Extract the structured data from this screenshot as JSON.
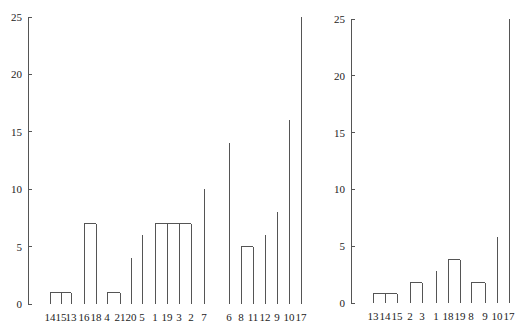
{
  "chart_data": [
    {
      "type": "dendrogram",
      "title": "",
      "ylim": [
        0,
        25
      ],
      "yticks": [
        0,
        5,
        10,
        15,
        20,
        25
      ],
      "leaves": [
        "14",
        "15",
        "13",
        "16",
        "18",
        "4",
        "21",
        "20",
        "5",
        "1",
        "19",
        "3",
        "2",
        "7",
        "6",
        "8",
        "11",
        "12",
        "9",
        "10",
        "17"
      ],
      "merges": [
        {
          "members": [
            "14",
            "15",
            "13"
          ],
          "height": 1
        },
        {
          "members": [
            "4",
            "21"
          ],
          "height": 1
        },
        {
          "members": [
            "(4,21)",
            "20"
          ],
          "height": 4
        },
        {
          "members": [
            "(4,21,20)",
            "5"
          ],
          "height": 6
        },
        {
          "members": [
            "(4,21,20,5)",
            "1",
            "19",
            "3",
            "2"
          ],
          "height": 7
        },
        {
          "members": [
            "16",
            "18"
          ],
          "height": 7
        },
        {
          "members": [
            "(16,18)",
            "(4,21,20,5,1,19,3,2)"
          ],
          "height": 8
        },
        {
          "members": [
            "(16..2)",
            "7"
          ],
          "height": 10
        },
        {
          "members": [
            "(14,15,13)",
            "(16..7)"
          ],
          "height": 13
        },
        {
          "members": [
            "(14..7)",
            "6"
          ],
          "height": 14
        },
        {
          "members": [
            "8",
            "11"
          ],
          "height": 5
        },
        {
          "members": [
            "(8,11)",
            "12"
          ],
          "height": 6
        },
        {
          "members": [
            "(8,11,12)",
            "9"
          ],
          "height": 8
        },
        {
          "members": [
            "(14..6)",
            "(8,11,12,9)",
            "10"
          ],
          "height": 16
        },
        {
          "members": [
            "(14..10)",
            "17"
          ],
          "height": 25
        }
      ]
    },
    {
      "type": "dendrogram",
      "title": "",
      "ylim": [
        0,
        25
      ],
      "yticks": [
        0,
        5,
        10,
        15,
        20,
        25
      ],
      "leaves": [
        "13",
        "14",
        "15",
        "2",
        "3",
        "1",
        "18",
        "19",
        "8",
        "9",
        "10",
        "17"
      ],
      "merges": [
        {
          "members": [
            "13",
            "14",
            "15"
          ],
          "height": 0.8
        },
        {
          "members": [
            "2",
            "3"
          ],
          "height": 1.8
        },
        {
          "members": [
            "(2,3)",
            "1"
          ],
          "height": 2.8
        },
        {
          "members": [
            "18",
            "19"
          ],
          "height": 3.8
        },
        {
          "members": [
            "(2,3,1)",
            "(18,19)"
          ],
          "height": 6.8
        },
        {
          "members": [
            "(13,14,15)",
            "(2,3,1,18,19)"
          ],
          "height": 9.8
        },
        {
          "members": [
            "8",
            "9"
          ],
          "height": 1.8
        },
        {
          "members": [
            "(8,9)",
            "10"
          ],
          "height": 5.8
        },
        {
          "members": [
            "(13..19)",
            "(8,9,10)"
          ],
          "height": 11.8
        },
        {
          "members": [
            "(13..10)",
            "17"
          ],
          "height": 25
        }
      ]
    }
  ]
}
